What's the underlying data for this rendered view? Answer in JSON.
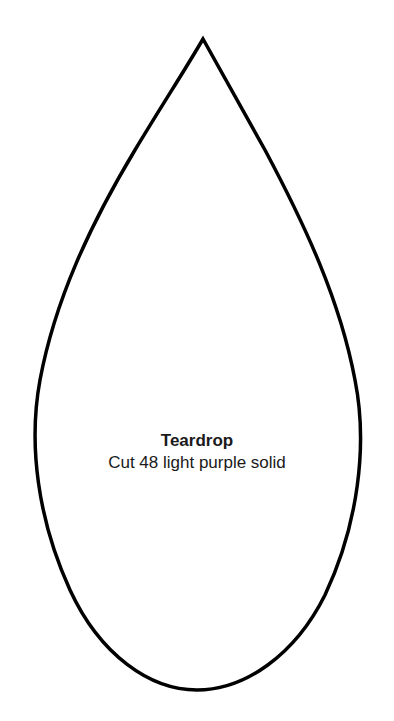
{
  "pattern": {
    "shape": "teardrop-outline",
    "stroke_color": "#000000",
    "fill_color": "#ffffff",
    "title": "Teardrop",
    "instruction": "Cut 48 light purple solid"
  }
}
